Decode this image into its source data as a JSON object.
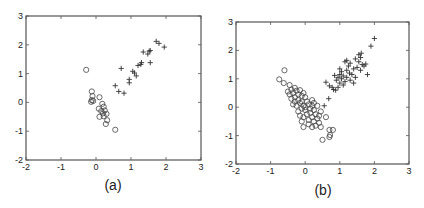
{
  "chart_data": [
    {
      "type": "scatter",
      "panel_label": "(a)",
      "xlim": [
        -2,
        3
      ],
      "ylim": [
        -2,
        3
      ],
      "xticks": [
        "-2",
        "-1",
        "0",
        "1",
        "2",
        "3"
      ],
      "yticks": [
        "3",
        "2",
        "1",
        "0",
        "-1",
        "-2"
      ],
      "grid": false,
      "frame": {
        "left": 26,
        "top": 16,
        "right": 201,
        "bottom": 160
      },
      "series": [
        {
          "name": "class-circle",
          "marker": "o",
          "points": [
            [
              -0.28,
              1.13
            ],
            [
              -0.12,
              0.38
            ],
            [
              -0.1,
              0.22
            ],
            [
              -0.12,
              0.08
            ],
            [
              -0.14,
              0.02
            ],
            [
              -0.08,
              0.05
            ],
            [
              0.1,
              0.18
            ],
            [
              0.18,
              -0.05
            ],
            [
              0.22,
              -0.15
            ],
            [
              0.08,
              -0.22
            ],
            [
              0.15,
              -0.3
            ],
            [
              0.25,
              -0.28
            ],
            [
              0.2,
              -0.38
            ],
            [
              0.3,
              -0.4
            ],
            [
              0.1,
              -0.5
            ],
            [
              0.32,
              -0.62
            ],
            [
              0.28,
              -0.75
            ],
            [
              0.55,
              -0.95
            ],
            [
              0.22,
              -0.48
            ]
          ]
        },
        {
          "name": "class-plus",
          "marker": "+",
          "points": [
            [
              0.55,
              0.58
            ],
            [
              0.65,
              0.38
            ],
            [
              0.8,
              0.32
            ],
            [
              0.72,
              1.18
            ],
            [
              0.95,
              0.8
            ],
            [
              0.95,
              0.68
            ],
            [
              1.05,
              1.08
            ],
            [
              1.1,
              1.02
            ],
            [
              1.15,
              0.92
            ],
            [
              1.2,
              1.28
            ],
            [
              1.28,
              1.32
            ],
            [
              1.3,
              1.38
            ],
            [
              1.35,
              1.75
            ],
            [
              1.48,
              1.68
            ],
            [
              1.52,
              1.78
            ],
            [
              1.55,
              1.38
            ],
            [
              1.55,
              1.8
            ],
            [
              1.72,
              2.12
            ],
            [
              1.8,
              2.05
            ],
            [
              1.95,
              1.92
            ]
          ]
        }
      ]
    },
    {
      "type": "scatter",
      "panel_label": "(b)",
      "xlim": [
        -2,
        3
      ],
      "ylim": [
        -2,
        3
      ],
      "xticks": [
        "-2",
        "-1",
        "0",
        "1",
        "2",
        "3"
      ],
      "yticks": [
        "3",
        "2",
        "1",
        "0",
        "-1",
        "-2"
      ],
      "grid": false,
      "frame": {
        "left": 236,
        "top": 22,
        "right": 409,
        "bottom": 164
      },
      "series": [
        {
          "name": "class-circle",
          "marker": "o",
          "points": [
            [
              -0.6,
              1.3
            ],
            [
              -0.75,
              0.98
            ],
            [
              -0.62,
              0.85
            ],
            [
              -0.45,
              0.78
            ],
            [
              -0.4,
              0.62
            ],
            [
              -0.5,
              0.55
            ],
            [
              -0.35,
              0.5
            ],
            [
              -0.3,
              0.68
            ],
            [
              -0.25,
              0.58
            ],
            [
              -0.2,
              0.45
            ],
            [
              -0.15,
              0.6
            ],
            [
              -0.1,
              0.4
            ],
            [
              -0.05,
              0.5
            ],
            [
              -0.3,
              0.35
            ],
            [
              -0.2,
              0.25
            ],
            [
              -0.1,
              0.2
            ],
            [
              0.0,
              0.35
            ],
            [
              0.05,
              0.2
            ],
            [
              -0.4,
              0.3
            ],
            [
              -0.35,
              0.1
            ],
            [
              -0.25,
              0.05
            ],
            [
              -0.15,
              0.15
            ],
            [
              -0.05,
              0.05
            ],
            [
              0.1,
              0.1
            ],
            [
              0.2,
              0.25
            ],
            [
              0.2,
              0.05
            ],
            [
              0.15,
              -0.05
            ],
            [
              0.0,
              -0.1
            ],
            [
              -0.1,
              -0.05
            ],
            [
              0.05,
              -0.25
            ],
            [
              0.15,
              -0.2
            ],
            [
              0.25,
              -0.1
            ],
            [
              0.3,
              -0.25
            ],
            [
              0.2,
              -0.35
            ],
            [
              0.1,
              -0.45
            ],
            [
              -0.05,
              -0.35
            ],
            [
              -0.15,
              -0.3
            ],
            [
              0.35,
              -0.4
            ],
            [
              0.25,
              -0.5
            ],
            [
              0.4,
              -0.55
            ],
            [
              0.3,
              -0.65
            ],
            [
              0.45,
              -0.7
            ],
            [
              0.2,
              -0.7
            ],
            [
              -0.05,
              -0.7
            ],
            [
              0.35,
              0.05
            ],
            [
              0.45,
              -0.15
            ],
            [
              0.6,
              -0.35
            ],
            [
              0.7,
              -0.8
            ],
            [
              0.8,
              -0.8
            ],
            [
              0.72,
              -0.98
            ],
            [
              0.7,
              -1.05
            ],
            [
              0.5,
              -1.15
            ],
            [
              -0.1,
              -0.5
            ],
            [
              0.4,
              -0.3
            ],
            [
              0.0,
              0.0
            ],
            [
              -0.2,
              -0.15
            ],
            [
              0.1,
              -0.6
            ],
            [
              -0.45,
              0.45
            ],
            [
              -0.3,
              0.2
            ],
            [
              0.25,
              0.15
            ]
          ]
        },
        {
          "name": "class-plus",
          "marker": "+",
          "points": [
            [
              0.55,
              0.05
            ],
            [
              0.6,
              0.88
            ],
            [
              0.7,
              0.75
            ],
            [
              0.68,
              0.3
            ],
            [
              0.82,
              0.62
            ],
            [
              0.88,
              0.6
            ],
            [
              0.95,
              0.7
            ],
            [
              0.9,
              0.95
            ],
            [
              1.0,
              0.85
            ],
            [
              1.05,
              1.0
            ],
            [
              1.0,
              1.15
            ],
            [
              1.1,
              0.78
            ],
            [
              1.1,
              1.1
            ],
            [
              1.15,
              0.9
            ],
            [
              1.2,
              1.05
            ],
            [
              1.2,
              1.3
            ],
            [
              1.25,
              1.45
            ],
            [
              1.28,
              1.2
            ],
            [
              1.3,
              0.95
            ],
            [
              1.35,
              1.15
            ],
            [
              1.4,
              1.35
            ],
            [
              1.45,
              1.05
            ],
            [
              1.5,
              1.4
            ],
            [
              1.55,
              1.6
            ],
            [
              1.55,
              1.85
            ],
            [
              1.6,
              1.75
            ],
            [
              1.62,
              1.9
            ],
            [
              1.65,
              1.5
            ],
            [
              1.7,
              1.45
            ],
            [
              1.6,
              1.3
            ],
            [
              1.75,
              1.52
            ],
            [
              1.8,
              1.15
            ],
            [
              1.2,
              1.65
            ],
            [
              1.3,
              1.55
            ],
            [
              1.0,
              1.35
            ],
            [
              0.85,
              1.12
            ],
            [
              1.45,
              1.7
            ],
            [
              1.9,
              2.15
            ],
            [
              2.0,
              2.42
            ],
            [
              1.15,
              1.6
            ],
            [
              1.05,
              1.25
            ],
            [
              0.95,
              1.05
            ],
            [
              1.4,
              0.85
            ],
            [
              0.78,
              0.7
            ]
          ]
        }
      ]
    }
  ],
  "captions": {
    "a": "(a)",
    "b": "(b)"
  }
}
